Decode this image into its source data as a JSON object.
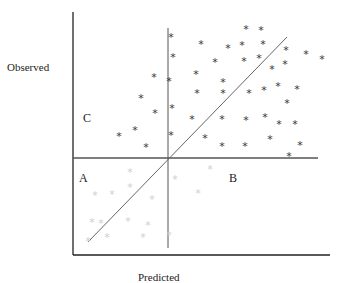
{
  "chart_data": {
    "type": "scatter",
    "title": "",
    "xlabel": "Predicted",
    "ylabel": "Observed",
    "grid": false,
    "legend": null,
    "quadrant_labels": [
      {
        "label": "C",
        "x": 86,
        "y": 118
      },
      {
        "label": "A",
        "x": 81,
        "y": 178
      },
      {
        "label": "B",
        "x": 232,
        "y": 178
      }
    ],
    "reference_lines": {
      "vertical_divider": {
        "x": 168,
        "y1": 28,
        "y2": 248
      },
      "horizontal_divider": {
        "y": 158,
        "x1": 73,
        "x2": 318
      },
      "diagonal": {
        "x1": 88,
        "y1": 242,
        "x2": 287,
        "y2": 37
      }
    },
    "axes": {
      "left_x": 73,
      "top_y": 12,
      "bottom_y": 255,
      "right_x": 330
    },
    "series": [
      {
        "name": "observed-above (dark)",
        "style": "dark",
        "points": [
          [
            171,
            36
          ],
          [
            201,
            43
          ],
          [
            246,
            28
          ],
          [
            261,
            29
          ],
          [
            228,
            47
          ],
          [
            242,
            44
          ],
          [
            263,
            43
          ],
          [
            286,
            49
          ],
          [
            306,
            53
          ],
          [
            322,
            58
          ],
          [
            173,
            56
          ],
          [
            215,
            61
          ],
          [
            244,
            60
          ],
          [
            259,
            57
          ],
          [
            272,
            68
          ],
          [
            285,
            63
          ],
          [
            196,
            73
          ],
          [
            223,
            81
          ],
          [
            169,
            80
          ],
          [
            223,
            92
          ],
          [
            197,
            92
          ],
          [
            249,
            92
          ],
          [
            264,
            89
          ],
          [
            278,
            85
          ],
          [
            297,
            88
          ],
          [
            287,
            102
          ],
          [
            172,
            107
          ],
          [
            192,
            118
          ],
          [
            222,
            118
          ],
          [
            246,
            119
          ],
          [
            265,
            116
          ],
          [
            279,
            123
          ],
          [
            295,
            123
          ],
          [
            171,
            134
          ],
          [
            205,
            137
          ],
          [
            222,
            145
          ],
          [
            245,
            145
          ],
          [
            270,
            138
          ],
          [
            300,
            144
          ],
          [
            289,
            155
          ],
          [
            154,
            76
          ],
          [
            141,
            97
          ],
          [
            155,
            112
          ],
          [
            135,
            129
          ],
          [
            119,
            135
          ],
          [
            146,
            146
          ]
        ]
      },
      {
        "name": "observed-below (faint)",
        "style": "faint",
        "points": [
          [
            130,
            171
          ],
          [
            130,
            186
          ],
          [
            95,
            194
          ],
          [
            112,
            193
          ],
          [
            152,
            198
          ],
          [
            175,
            178
          ],
          [
            210,
            168
          ],
          [
            198,
            192
          ],
          [
            92,
            221
          ],
          [
            101,
            222
          ],
          [
            128,
            220
          ],
          [
            148,
            224
          ],
          [
            107,
            236
          ],
          [
            143,
            236
          ],
          [
            169,
            234
          ],
          [
            88,
            240
          ]
        ]
      }
    ]
  },
  "labels": {
    "observed": "Observed",
    "predicted": "Predicted",
    "quad_c": "C",
    "quad_a": "A",
    "quad_b": "B"
  },
  "star_glyph": "*",
  "colors": {
    "axis": "#222222",
    "divider": "#555555",
    "diagonal": "#666666",
    "star_dark": "#333333",
    "star_faint": "#cfcfcf"
  }
}
